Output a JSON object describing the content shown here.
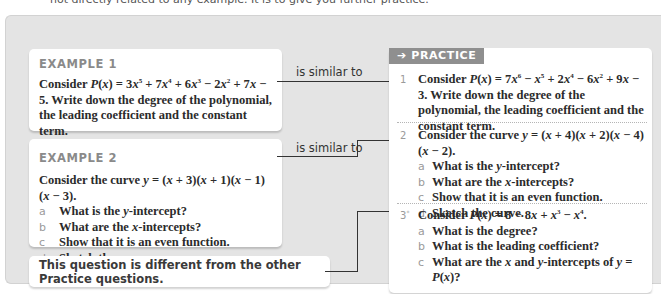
{
  "intro_text": "not directly related to any example. It is to give you further practice.",
  "examples": [
    {
      "title": "EXAMPLE 1",
      "question_html": "Consider <i>P</i>(<i>x</i>) = 3<i>x</i><sup>5</sup> + 7<i>x</i><sup>4</sup> + 6<i>x</i><sup>3</sup> − 2<i>x</i><sup>2</sup> + 7<i>x</i> − 5. Write down the degree of the polynomial, the leading coefficient and the constant term.",
      "parts": []
    },
    {
      "title": "EXAMPLE 2",
      "question_html": "Consider the curve <i>y</i> = (<i>x</i> + 3)(<i>x</i> + 1)(<i>x</i> − 1)(<i>x</i> − 3).",
      "parts": [
        {
          "label": "a",
          "html": "What is the <i>y</i>-intercept?"
        },
        {
          "label": "b",
          "html": "What are the <i>x</i>-intercepts?"
        },
        {
          "label": "c",
          "html": "Show that it is an even function."
        },
        {
          "label": "d",
          "html": "Sketch the curve."
        }
      ]
    }
  ],
  "connectors": {
    "similar_1": "is similar to",
    "similar_2": "is similar to"
  },
  "note": "This question is different from the other Practice questions.",
  "practice": {
    "badge_icon": "arrow-right-icon",
    "badge_arrow": "➔",
    "badge_label": "PRACTICE",
    "items": [
      {
        "number": "1",
        "question_html": "Consider <i>P</i>(<i>x</i>) = 7<i>x</i><sup>6</sup> − <i>x</i><sup>5</sup> + 2<i>x</i><sup>4</sup> − 6<i>x</i><sup>2</sup> + 9<i>x</i> − 3. Write down the degree of the polynomial, the leading coefficient and the constant term.",
        "parts": []
      },
      {
        "number": "2",
        "question_html": "Consider the curve <i>y</i> = (<i>x</i> + 4)(<i>x</i> + 2)(<i>x</i> − 4)(<i>x</i> − 2).",
        "parts": [
          {
            "label": "a",
            "html": "What is the <i>y</i>-intercept?"
          },
          {
            "label": "b",
            "html": "What are the <i>x</i>-intercepts?"
          },
          {
            "label": "c",
            "html": "Show that it is an even function."
          },
          {
            "label": "d",
            "html": "Sketch the curve."
          }
        ]
      },
      {
        "number": "3",
        "number_mark": "*",
        "question_html": "Consider <i>P</i>(<i>x</i>) = 8 − 8<i>x</i> + <i>x</i><sup>3</sup> − <i>x</i><sup>4</sup>.",
        "parts": [
          {
            "label": "a",
            "html": "What is the degree?"
          },
          {
            "label": "b",
            "html": "What is the leading coefficient?"
          },
          {
            "label": "c",
            "html": "What are the <i>x</i> and <i>y</i>-intercepts of <i>y</i> = <i>P</i>(<i>x</i>)?"
          }
        ]
      }
    ]
  },
  "colors": {
    "panel_bg": "#e4e4e4",
    "card_bg": "#ffffff",
    "badge_bg": "#8f8f8f",
    "title_gray": "#8a8a8a",
    "line": "#333333"
  }
}
